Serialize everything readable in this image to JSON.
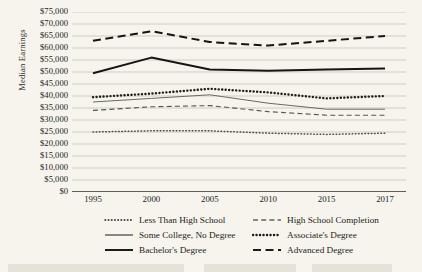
{
  "chart_data": {
    "type": "line",
    "title": "",
    "xlabel": "",
    "ylabel": "Median Earnings",
    "categories": [
      "1995",
      "2000",
      "2005",
      "2010",
      "2015",
      "2017"
    ],
    "x": [
      1995,
      2000,
      2005,
      2010,
      2015,
      2017
    ],
    "ylim": [
      0,
      75000
    ],
    "ytick_step": 5000,
    "grid": true,
    "legend_position": "bottom",
    "ytick_labels": [
      "$75,000",
      "$70,000",
      "$65,000",
      "$60,000",
      "$55,000",
      "$50,000",
      "$45,000",
      "$40,000",
      "$35,000",
      "$30,000",
      "$25,000",
      "$20,000",
      "$15,000",
      "$10,000",
      "$5,000",
      "$0"
    ],
    "ytick_values": [
      75000,
      70000,
      65000,
      60000,
      55000,
      50000,
      45000,
      40000,
      35000,
      30000,
      25000,
      20000,
      15000,
      10000,
      5000,
      0
    ],
    "series": [
      {
        "name": "Less Than High School",
        "style": "fine-dotted",
        "color": "#4a4a44",
        "values": [
          25000,
          25500,
          25500,
          24500,
          24000,
          24500
        ]
      },
      {
        "name": "High School Completion",
        "style": "dashed-thin",
        "color": "#55554e",
        "values": [
          34000,
          35500,
          36000,
          33500,
          32000,
          32000
        ]
      },
      {
        "name": "Some College, No Degree",
        "style": "solid-thin",
        "color": "#6b6b63",
        "values": [
          37500,
          39000,
          40500,
          37000,
          34500,
          34500
        ]
      },
      {
        "name": "Associate's Degree",
        "style": "bold-dotted",
        "color": "#1e1e1b",
        "values": [
          39500,
          41000,
          43000,
          41500,
          39000,
          40000
        ]
      },
      {
        "name": "Bachelor's Degree",
        "style": "solid-thick",
        "color": "#151513",
        "values": [
          49500,
          56000,
          51000,
          50500,
          51000,
          51500
        ]
      },
      {
        "name": "Advanced Degree",
        "style": "long-dashed",
        "color": "#151513",
        "values": [
          63000,
          67000,
          62500,
          61000,
          63000,
          65000
        ]
      }
    ]
  },
  "legend": {
    "items": [
      {
        "label": "Less Than High School",
        "style": "fine-dotted"
      },
      {
        "label": "High School Completion",
        "style": "dashed-thin"
      },
      {
        "label": "Some College, No Degree",
        "style": "solid-thin"
      },
      {
        "label": "Associate's Degree",
        "style": "bold-dotted"
      },
      {
        "label": "Bachelor's Degree",
        "style": "solid-thick"
      },
      {
        "label": "Advanced Degree",
        "style": "long-dashed"
      }
    ]
  },
  "colors": {
    "background": "#f6f4ec",
    "grid": "#b9b6aa",
    "axis": "#2b2b26",
    "text": "#1d1d1a"
  }
}
